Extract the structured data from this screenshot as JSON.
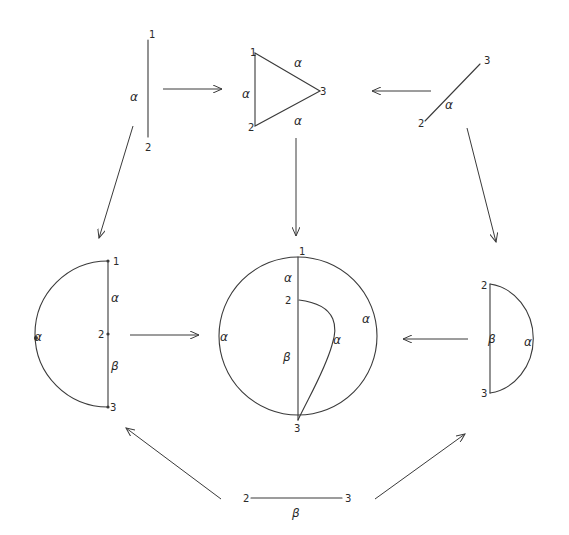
{
  "diagram": {
    "colors": {
      "ink": "#3a3a3a",
      "background": "#ffffff"
    },
    "nodes": {
      "segment_12_alpha": {
        "labels": {
          "top": "1",
          "bottom": "2",
          "edge": "α"
        }
      },
      "triangle_123_alpha": {
        "labels": {
          "v1": "1",
          "v2": "2",
          "v3": "3",
          "edge_12": "α",
          "edge_13": "α",
          "edge_23": "α"
        }
      },
      "segment_23_alpha": {
        "labels": {
          "top": "3",
          "bottom": "2",
          "edge": "α"
        }
      },
      "halfdisc_left": {
        "labels": {
          "v1": "1",
          "v2": "2",
          "v3": "3",
          "edge_12": "α",
          "edge_23": "β",
          "arc": "α"
        }
      },
      "disc_center": {
        "labels": {
          "v1": "1",
          "v2": "2",
          "v3": "3",
          "edge_12": "α",
          "edge_23": "β",
          "arc_left": "α",
          "arc_right": "α",
          "inner_curve": "α"
        }
      },
      "halfdisc_right": {
        "labels": {
          "v2": "2",
          "v3": "3",
          "edge_23": "β",
          "arc": "α"
        }
      },
      "segment_23_beta": {
        "labels": {
          "left": "2",
          "right": "3",
          "edge": "β"
        }
      }
    },
    "arrows": [
      {
        "from": "segment_12_alpha",
        "to": "triangle_123_alpha"
      },
      {
        "from": "segment_23_alpha",
        "to": "triangle_123_alpha"
      },
      {
        "from": "segment_12_alpha",
        "to": "halfdisc_left"
      },
      {
        "from": "triangle_123_alpha",
        "to": "disc_center"
      },
      {
        "from": "segment_23_alpha",
        "to": "halfdisc_right"
      },
      {
        "from": "halfdisc_left",
        "to": "disc_center"
      },
      {
        "from": "halfdisc_right",
        "to": "disc_center"
      },
      {
        "from": "segment_23_beta",
        "to": "halfdisc_left"
      },
      {
        "from": "segment_23_beta",
        "to": "halfdisc_right"
      }
    ]
  }
}
